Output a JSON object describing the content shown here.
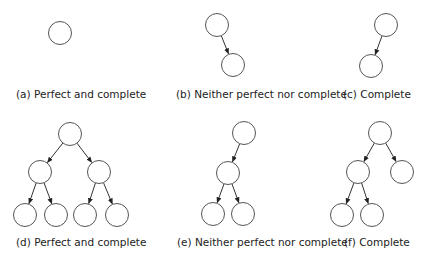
{
  "figures": [
    {
      "id": "a",
      "caption": "(a) Perfect and complete",
      "caption_x": 16,
      "caption_y": 98,
      "nodes": [
        [
          60,
          33
        ]
      ],
      "edges": []
    },
    {
      "id": "b",
      "caption": "(b) Neither perfect nor complete",
      "caption_x": 176,
      "caption_y": 98,
      "nodes": [
        [
          217,
          25
        ],
        [
          233,
          65
        ]
      ],
      "edges": [
        [
          0,
          1
        ]
      ]
    },
    {
      "id": "c",
      "caption": "(c) Complete",
      "caption_x": 343,
      "caption_y": 98,
      "nodes": [
        [
          386,
          25
        ],
        [
          371,
          66
        ]
      ],
      "edges": [
        [
          0,
          1
        ]
      ]
    },
    {
      "id": "d",
      "caption": "(d) Perfect and complete",
      "caption_x": 16,
      "caption_y": 246,
      "nodes": [
        [
          70,
          134
        ],
        [
          40,
          172
        ],
        [
          99,
          172
        ],
        [
          25,
          215
        ],
        [
          56,
          215
        ],
        [
          85,
          215
        ],
        [
          117,
          215
        ]
      ],
      "edges": [
        [
          0,
          1
        ],
        [
          0,
          2
        ],
        [
          1,
          3
        ],
        [
          1,
          4
        ],
        [
          2,
          5
        ],
        [
          2,
          6
        ]
      ]
    },
    {
      "id": "e",
      "caption": "(e) Neither perfect nor complete",
      "caption_x": 177,
      "caption_y": 246,
      "nodes": [
        [
          244,
          133
        ],
        [
          228,
          173
        ],
        [
          213,
          214
        ],
        [
          243,
          214
        ]
      ],
      "edges": [
        [
          0,
          1
        ],
        [
          1,
          2
        ],
        [
          1,
          3
        ]
      ]
    },
    {
      "id": "f",
      "caption": "(f) Complete",
      "caption_x": 344,
      "caption_y": 246,
      "nodes": [
        [
          380,
          133
        ],
        [
          358,
          172
        ],
        [
          402,
          172
        ],
        [
          342,
          215
        ],
        [
          372,
          215
        ]
      ],
      "edges": [
        [
          0,
          1
        ],
        [
          0,
          2
        ],
        [
          1,
          3
        ],
        [
          1,
          4
        ]
      ]
    }
  ],
  "node_radius": 11.5
}
